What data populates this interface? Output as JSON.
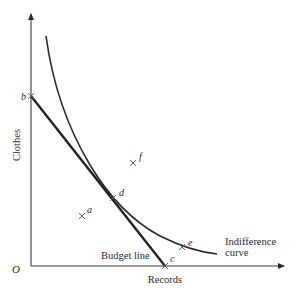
{
  "diagram": {
    "type": "indifference-curve-budget-line",
    "axes": {
      "x_label": "Records",
      "y_label": "Clothes",
      "origin_label": "O"
    },
    "curves": {
      "budget_line_label": "Budget line",
      "indifference_curve_label_line1": "Indifference",
      "indifference_curve_label_line2": "curve"
    },
    "points": [
      {
        "id": "b",
        "label": "b",
        "description": "budget line intercept on Clothes axis"
      },
      {
        "id": "c",
        "label": "c",
        "description": "budget line intercept on Records axis"
      },
      {
        "id": "d",
        "label": "d",
        "description": "tangency of budget line and indifference curve"
      },
      {
        "id": "a",
        "label": "a",
        "description": "point inside budget set"
      },
      {
        "id": "e",
        "label": "e",
        "description": "point on indifference curve beyond budget"
      },
      {
        "id": "f",
        "label": "f",
        "description": "point above indifference curve"
      }
    ],
    "colors": {
      "ink": "#2a2a2a",
      "background": "#ffffff"
    }
  }
}
